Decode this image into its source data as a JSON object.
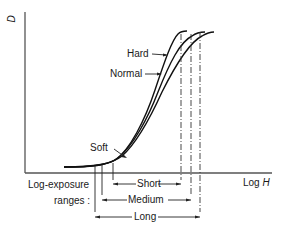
{
  "axes": {
    "y_label": "D",
    "x_label_prefix": "Log ",
    "x_label_var": "H"
  },
  "curves": [
    {
      "name": "Hard",
      "label": "Hard"
    },
    {
      "name": "Normal",
      "label": "Normal"
    },
    {
      "name": "Soft",
      "label": "Soft"
    }
  ],
  "ranges": {
    "title_line1": "Log-exposure",
    "title_line2": "ranges :",
    "items": [
      {
        "label": "Short"
      },
      {
        "label": "Medium"
      },
      {
        "label": "Long"
      }
    ]
  },
  "colors": {
    "ink": "#1a1a1a",
    "background": "#ffffff"
  }
}
